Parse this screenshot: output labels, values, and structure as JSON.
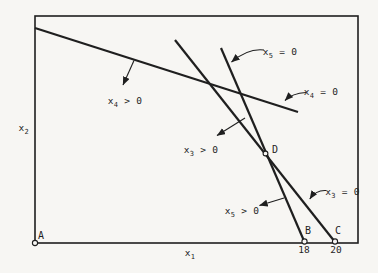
{
  "colors": {
    "paper": "#f7f6f3",
    "ink": "#1f1f1f"
  },
  "figure": {
    "x_axis_label": {
      "base": "x",
      "sub": "1"
    },
    "y_axis_label": {
      "base": "x",
      "sub": "2"
    },
    "points": {
      "A": {
        "label": "A"
      },
      "B": {
        "label": "B",
        "tick": "18"
      },
      "C": {
        "label": "C",
        "tick": "20"
      },
      "D": {
        "label": "D"
      }
    },
    "line_labels": {
      "x5_eq_0": {
        "base": "x",
        "sub": "5",
        "rest": " = 0"
      },
      "x4_eq_0": {
        "base": "x",
        "sub": "4",
        "rest": " = 0"
      },
      "x3_eq_0": {
        "base": "x",
        "sub": "3",
        "rest": " = 0"
      }
    },
    "region_labels": {
      "x4_gt_0": {
        "base": "x",
        "sub": "4",
        "rest": " > 0"
      },
      "x3_gt_0": {
        "base": "x",
        "sub": "3",
        "rest": " > 0"
      },
      "x5_gt_0": {
        "base": "x",
        "sub": "5",
        "rest": " > 0"
      }
    }
  }
}
